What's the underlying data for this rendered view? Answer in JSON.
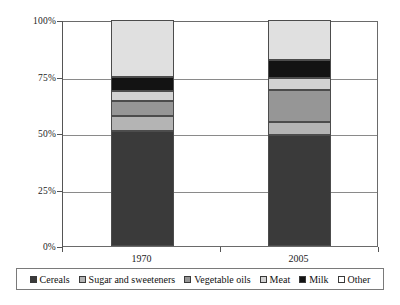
{
  "chart_data": {
    "type": "bar",
    "subtype": "stacked-100-percent",
    "title": "",
    "subtitle": "",
    "xlabel": "",
    "ylabel": "",
    "categories": [
      "1970",
      "2005"
    ],
    "ytick_labels": [
      "0%",
      "25%",
      "50%",
      "75%",
      "100%"
    ],
    "ytick_values": [
      0,
      25,
      50,
      75,
      100
    ],
    "ylim": [
      0,
      100
    ],
    "grid": true,
    "legend_position": "bottom",
    "stack_order_bottom_to_top": [
      "Cereals",
      "Sugar and sweeteners",
      "Vegetable oils",
      "Meat",
      "Milk",
      "Other"
    ],
    "series": [
      {
        "name": "Cereals",
        "values": [
          51.0,
          49.0
        ],
        "color": "#3a3a3a"
      },
      {
        "name": "Sugar and sweeteners",
        "values": [
          6.5,
          6.0
        ],
        "color": "#b4b4b4"
      },
      {
        "name": "Vegetable oils",
        "values": [
          6.5,
          14.0
        ],
        "color": "#969696"
      },
      {
        "name": "Meat",
        "values": [
          4.5,
          5.5
        ],
        "color": "#d2d2d2"
      },
      {
        "name": "Milk",
        "values": [
          6.5,
          8.0
        ],
        "color": "#131313"
      },
      {
        "name": "Other",
        "values": [
          25.0,
          17.5
        ],
        "color": "#e0e0e0"
      }
    ]
  },
  "axes": {
    "y_ticks": [
      {
        "label": "100%",
        "value": 100
      },
      {
        "label": "75%",
        "value": 75
      },
      {
        "label": "50%",
        "value": 50
      },
      {
        "label": "25%",
        "value": 25
      },
      {
        "label": "0%",
        "value": 0
      }
    ],
    "x_ticks": [
      {
        "label": "1970"
      },
      {
        "label": "2005"
      }
    ]
  },
  "legend": {
    "items": [
      {
        "label": "Cereals",
        "swatch": "#3a3a3a"
      },
      {
        "label": "Sugar and sweeteners",
        "swatch": "#b4b4b4"
      },
      {
        "label": "Vegetable oils",
        "swatch": "#969696"
      },
      {
        "label": "Meat",
        "swatch": "#d2d2d2"
      },
      {
        "label": "Milk",
        "swatch": "#131313"
      },
      {
        "label": "Other",
        "swatch": "#ffffff"
      }
    ]
  }
}
